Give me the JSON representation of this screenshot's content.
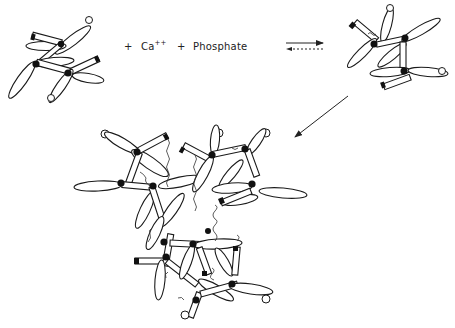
{
  "figure": {
    "type": "reaction-scheme",
    "reactant_label_plus1": "+",
    "reactant_ca": "Ca",
    "reactant_ca_charge": "++",
    "reactant_label_plus2": "+",
    "reactant_phosphate": "Phosphate",
    "equilibrium": {
      "forward": "solid arrow right",
      "reverse": "dashed arrow left"
    },
    "stages": [
      {
        "id": "monomer",
        "description": "molecule with ellipsoidal arms, rods and terminal circles",
        "position": "top-left"
      },
      {
        "id": "bound-complex",
        "description": "Ca/phosphate bound molecule",
        "position": "top-right"
      },
      {
        "id": "aggregate",
        "description": "cross-linked aggregate cluster",
        "position": "bottom-center"
      }
    ],
    "colors": {
      "line": "#1a1a1a",
      "node": "#111111",
      "background": "#ffffff"
    }
  }
}
